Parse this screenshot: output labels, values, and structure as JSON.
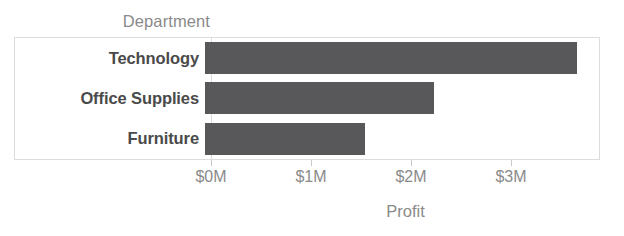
{
  "chart_data": {
    "type": "bar",
    "orientation": "horizontal",
    "title": "",
    "xlabel": "Profit",
    "ylabel": "Department",
    "categories": [
      "Technology",
      "Office Supplies",
      "Furniture"
    ],
    "values": [
      3.67,
      2.26,
      1.58
    ],
    "value_unit": "M",
    "xlim": [
      0,
      3.89
    ],
    "xticks": [
      0,
      1,
      2,
      3
    ],
    "xticklabels": [
      "$0M",
      "$1M",
      "$2M",
      "$3M"
    ],
    "grid": false,
    "legend": null,
    "bar_color": "#58585a",
    "label_color": "#4a4a4a",
    "axis_text_color": "#8a8a8a",
    "frame_color": "#dcdcdc"
  },
  "header": {
    "department_label": "Department"
  },
  "axis": {
    "x_title": "Profit"
  }
}
